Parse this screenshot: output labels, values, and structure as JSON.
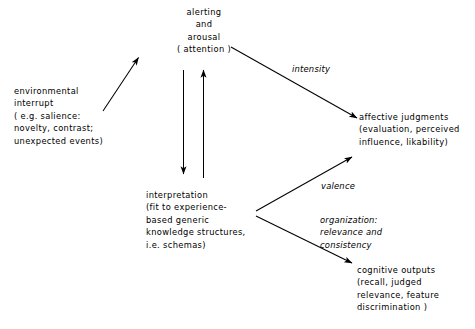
{
  "diagram": {
    "nodes": [
      {
        "id": "alerting",
        "name": "node-alerting-arousal",
        "text": "alerting\nand\narousal\n( attention )",
        "align": "center"
      },
      {
        "id": "environmental_interrupt",
        "name": "node-environmental-interrupt",
        "text": "environmental\ninterrupt\n( e.g. salience:\nnovelty, contrast;\nunexpected events)",
        "align": "left"
      },
      {
        "id": "interpretation",
        "name": "node-interpretation",
        "text": "interpretation\n(fit to experience-\nbased generic\nknowledge structures,\ni.e. schemas)",
        "align": "left"
      },
      {
        "id": "affective_judgments",
        "name": "node-affective-judgments",
        "text": "affective judgments\n(evaluation, perceived\ninfluence, likability)",
        "align": "left"
      },
      {
        "id": "cognitive_outputs",
        "name": "node-cognitive-outputs",
        "text": "cognitive outputs\n(recall, judged\nrelevance, feature\ndiscrimination )",
        "align": "left"
      }
    ],
    "edge_labels": [
      {
        "id": "intensity",
        "name": "edge-label-intensity",
        "text": "intensity"
      },
      {
        "id": "valence",
        "name": "edge-label-valence",
        "text": "valence"
      },
      {
        "id": "organization",
        "name": "edge-label-organization",
        "text": "organization:\nrelevance and\nconsistency"
      }
    ],
    "edges": [
      {
        "id": "interrupt_to_alerting",
        "name": "arrow-interrupt-to-alerting",
        "from": "environmental_interrupt",
        "to": "alerting",
        "label": ""
      },
      {
        "id": "alerting_to_interpretation",
        "name": "arrow-alerting-to-interpretation",
        "from": "alerting",
        "to": "interpretation",
        "label": ""
      },
      {
        "id": "interpretation_to_alerting",
        "name": "arrow-interpretation-to-alerting",
        "from": "interpretation",
        "to": "alerting",
        "label": ""
      },
      {
        "id": "alerting_to_affective",
        "name": "arrow-alerting-to-affective",
        "from": "alerting",
        "to": "affective_judgments",
        "label": "intensity"
      },
      {
        "id": "interpretation_to_affective",
        "name": "arrow-interpretation-to-affective",
        "from": "interpretation",
        "to": "affective_judgments",
        "label": "valence"
      },
      {
        "id": "interpretation_to_cognitive",
        "name": "arrow-interpretation-to-cognitive",
        "from": "interpretation",
        "to": "cognitive_outputs",
        "label": "organization"
      }
    ],
    "colors": {
      "background": "#ffffff",
      "ink": "#000000"
    }
  }
}
